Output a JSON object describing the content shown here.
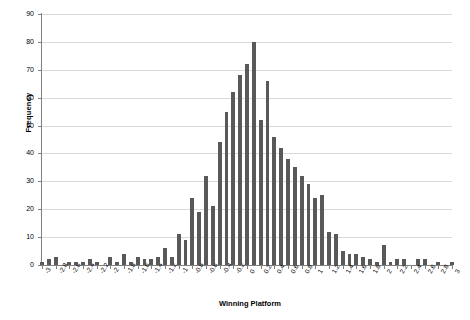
{
  "chart_data": {
    "type": "bar",
    "title": "",
    "xlabel": "Winning Platform",
    "ylabel": "Frequency",
    "ylim": [
      0,
      90
    ],
    "ytick_step": 10,
    "yticks": [
      0,
      10,
      20,
      30,
      40,
      50,
      60,
      70,
      80,
      90
    ],
    "xlim": [
      -3,
      3
    ],
    "xtick_step": 0.2,
    "grid": "horizontal",
    "legend": "none",
    "bar_color": "#595959",
    "background_color": "#ffffff",
    "gridline_color": "#d9d9d9",
    "axis_color": "#808080",
    "xticks": [
      "-3",
      "-2.8",
      "-2.6",
      "-2.4",
      "-2.2",
      "-2",
      "-1.8",
      "-1.6",
      "-1.4",
      "-1.2",
      "-1",
      "-0.8",
      "-0.6",
      "-0.4",
      "-0.2",
      "0",
      "0.2",
      "0.4",
      "0.6",
      "0.8",
      "1",
      "1.2",
      "1.4",
      "1.6",
      "1.8",
      "2",
      "2.2",
      "2.4",
      "2.6",
      "2.8",
      "3"
    ],
    "bin_width": 0.1,
    "categories": [
      -3.0,
      -2.9,
      -2.8,
      -2.7,
      -2.6,
      -2.5,
      -2.4,
      -2.3,
      -2.2,
      -2.1,
      -2.0,
      -1.9,
      -1.8,
      -1.7,
      -1.6,
      -1.5,
      -1.4,
      -1.3,
      -1.2,
      -1.1,
      -1.0,
      -0.9,
      -0.8,
      -0.7,
      -0.6,
      -0.5,
      -0.4,
      -0.3,
      -0.2,
      -0.1,
      0.0,
      0.1,
      0.2,
      0.3,
      0.4,
      0.5,
      0.6,
      0.7,
      0.8,
      0.9,
      1.0,
      1.1,
      1.2,
      1.3,
      1.4,
      1.5,
      1.6,
      1.7,
      1.8,
      1.9,
      2.0,
      2.1,
      2.2,
      2.3,
      2.4,
      2.5,
      2.6,
      2.7,
      2.8,
      2.9,
      3.0
    ],
    "values": [
      1,
      2,
      3,
      0,
      1,
      1,
      1,
      2,
      1,
      0,
      3,
      1,
      4,
      1,
      3,
      2,
      2,
      3,
      6,
      3,
      11,
      9,
      24,
      19,
      32,
      21,
      44,
      55,
      62,
      68,
      72,
      80,
      52,
      66,
      46,
      42,
      38,
      35,
      32,
      29,
      24,
      25,
      12,
      11,
      5,
      4,
      4,
      3,
      2,
      1,
      7,
      1,
      2,
      2,
      0,
      2,
      2,
      0,
      1,
      0,
      1
    ]
  }
}
